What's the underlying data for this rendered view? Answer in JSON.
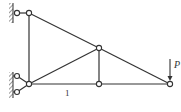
{
  "diagram": {
    "type": "truss",
    "labels": {
      "member_label": "1",
      "load_label": "P"
    },
    "nodes": [
      {
        "id": "A",
        "x": 29,
        "y": 13,
        "note": "top-left, hinged to wall"
      },
      {
        "id": "B",
        "x": 29,
        "y": 84,
        "note": "bottom-left, pinned to wall"
      },
      {
        "id": "C",
        "x": 99,
        "y": 48,
        "note": "middle upper"
      },
      {
        "id": "D",
        "x": 99,
        "y": 84,
        "note": "bottom middle"
      },
      {
        "id": "E",
        "x": 170,
        "y": 84,
        "note": "right end, load applied"
      }
    ],
    "members": [
      {
        "from": "A",
        "to": "B"
      },
      {
        "from": "A",
        "to": "C"
      },
      {
        "from": "C",
        "to": "E"
      },
      {
        "from": "B",
        "to": "C"
      },
      {
        "from": "B",
        "to": "D",
        "label": "1"
      },
      {
        "from": "D",
        "to": "E"
      },
      {
        "from": "C",
        "to": "D"
      }
    ],
    "supports": [
      {
        "type": "wall-link",
        "at": "A"
      },
      {
        "type": "wall-pin-double",
        "at": "B"
      }
    ],
    "load": {
      "at": "E",
      "direction": "down",
      "label": "P"
    }
  }
}
